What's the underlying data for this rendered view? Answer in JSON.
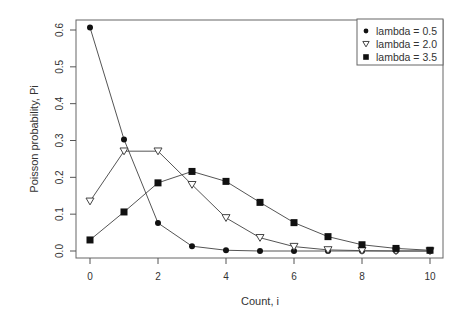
{
  "chart_data": {
    "type": "line",
    "title": "",
    "xlabel": "Count, i",
    "ylabel": "Poisson probability, Pi",
    "x": [
      0,
      1,
      2,
      3,
      4,
      5,
      6,
      7,
      8,
      9,
      10
    ],
    "xlim": [
      0,
      10
    ],
    "ylim": [
      0,
      0.6
    ],
    "x_ticks": [
      0,
      2,
      4,
      6,
      8,
      10
    ],
    "y_ticks": [
      0.0,
      0.1,
      0.2,
      0.3,
      0.4,
      0.5,
      0.6
    ],
    "y_tick_labels": [
      "0.0",
      "0.1",
      "0.2",
      "0.3",
      "0.4",
      "0.5",
      "0.6"
    ],
    "grid": false,
    "legend_position": "top-right",
    "series": [
      {
        "name": "lambda = 0.5",
        "marker": "filled-circle",
        "values": [
          0.607,
          0.303,
          0.076,
          0.013,
          0.002,
          0.0,
          0.0,
          0.0,
          0.0,
          0.0,
          0.0
        ]
      },
      {
        "name": "lambda = 2.0",
        "marker": "open-down-triangle",
        "values": [
          0.135,
          0.271,
          0.271,
          0.18,
          0.09,
          0.036,
          0.012,
          0.003,
          0.001,
          0.0,
          0.0
        ]
      },
      {
        "name": "lambda = 3.5",
        "marker": "filled-square",
        "values": [
          0.03,
          0.106,
          0.185,
          0.216,
          0.189,
          0.132,
          0.077,
          0.039,
          0.017,
          0.007,
          0.002
        ]
      }
    ]
  },
  "colors": {
    "line": "#555555",
    "marker": "#111111",
    "axis": "#555555",
    "text": "#333333"
  }
}
